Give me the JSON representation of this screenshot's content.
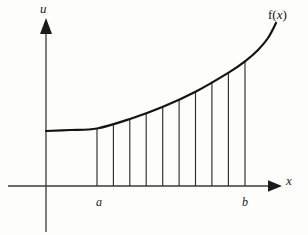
{
  "figure": {
    "background_color": "#fdfdfc",
    "ink_color": "#1b1b1b"
  },
  "axes": {
    "vertical": {
      "name": "u-axis",
      "label": "u",
      "origin_x": 46,
      "top_y": 18,
      "bottom_y": 232,
      "arrow": "up-arrow"
    },
    "horizontal": {
      "name": "x-axis",
      "label": "x",
      "origin_y": 186,
      "left_x": 8,
      "right_x": 282,
      "arrow": "right-arrow"
    }
  },
  "tick_labels": [
    {
      "text": "a",
      "x": 97,
      "axis": "x"
    },
    {
      "text": "b",
      "x": 245,
      "axis": "x"
    }
  ],
  "curve": {
    "label": "f(x)",
    "label_function": "f",
    "label_variable": "x",
    "stroke_color": "#141414",
    "stroke_width": 2.2
  },
  "chart_data": {
    "type": "line",
    "title": "",
    "xlabel": "x",
    "ylabel": "u",
    "grid": false,
    "legend": null,
    "annotations": [
      {
        "text": "f(x)",
        "x": 278,
        "y": 14
      },
      {
        "text": "a",
        "x": 97,
        "y": 198
      },
      {
        "text": "b",
        "x": 245,
        "y": 198
      }
    ],
    "axis_pixel_frame": {
      "origin": [
        46,
        186
      ],
      "x_max": 282,
      "y_min": 18
    },
    "interval": {
      "a_label": "a",
      "b_label": "b",
      "a_px": 97,
      "b_px": 245
    },
    "ordinate_count": 10,
    "ordinates_px_x": [
      97,
      113.4,
      129.8,
      146.2,
      162.7,
      179.1,
      195.5,
      211.9,
      228.4,
      245
    ],
    "ordinates_px_top_y": [
      128.5,
      124.0,
      119.0,
      113.3,
      106.9,
      99.7,
      91.6,
      82.6,
      72.6,
      61.4
    ],
    "ordinates_px_bottom_y": 186,
    "curve_points_px": [
      [
        46,
        131.0
      ],
      [
        70,
        130.0
      ],
      [
        97,
        128.5
      ],
      [
        130,
        119.0
      ],
      [
        163,
        106.8
      ],
      [
        196,
        91.5
      ],
      [
        229,
        72.4
      ],
      [
        245,
        61.4
      ],
      [
        258,
        50.0
      ],
      [
        268,
        38.0
      ],
      [
        276,
        23.0
      ]
    ],
    "series": [
      {
        "name": "f(x)",
        "description": "increasing convex curve",
        "x": [
          46,
          70,
          97,
          130,
          163,
          196,
          229,
          245,
          258,
          268,
          276
        ],
        "y": [
          131.0,
          130.0,
          128.5,
          119.0,
          106.8,
          91.5,
          72.4,
          61.4,
          50.0,
          38.0,
          23.0
        ]
      }
    ]
  }
}
